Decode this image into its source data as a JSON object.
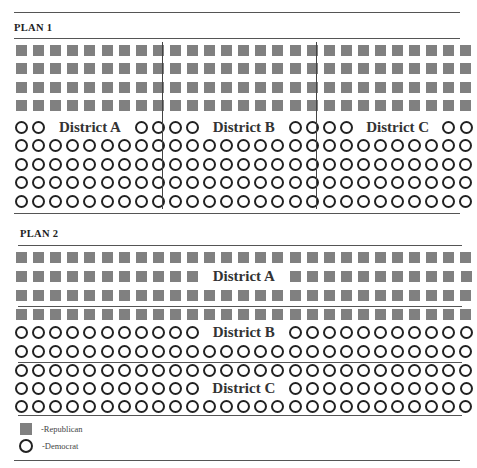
{
  "plans": [
    {
      "title": "PLAN 1",
      "columns": 27,
      "layout": "vertical-split",
      "districts": [
        {
          "label": "District A",
          "columns": 9,
          "republican_rows": 4,
          "democrat_rows": 5
        },
        {
          "label": "District B",
          "columns": 9,
          "republican_rows": 4,
          "democrat_rows": 5
        },
        {
          "label": "District C",
          "columns": 9,
          "republican_rows": 4,
          "democrat_rows": 5
        }
      ]
    },
    {
      "title": "PLAN 2",
      "columns": 27,
      "layout": "horizontal-split",
      "districts": [
        {
          "label": "District A",
          "rows": [
            "R",
            "R",
            "R"
          ]
        },
        {
          "label": "District B",
          "rows": [
            "R",
            "D",
            "D"
          ]
        },
        {
          "label": "District C",
          "rows": [
            "D",
            "D",
            "D"
          ]
        }
      ]
    }
  ],
  "legend": [
    {
      "symbol": "filled-square",
      "label": "-Republican",
      "color": "#808080"
    },
    {
      "symbol": "open-circle",
      "label": "-Democrat",
      "color": "#222222"
    }
  ],
  "colors": {
    "republican": "#808080",
    "democrat_stroke": "#222222",
    "rule": "#555555"
  }
}
